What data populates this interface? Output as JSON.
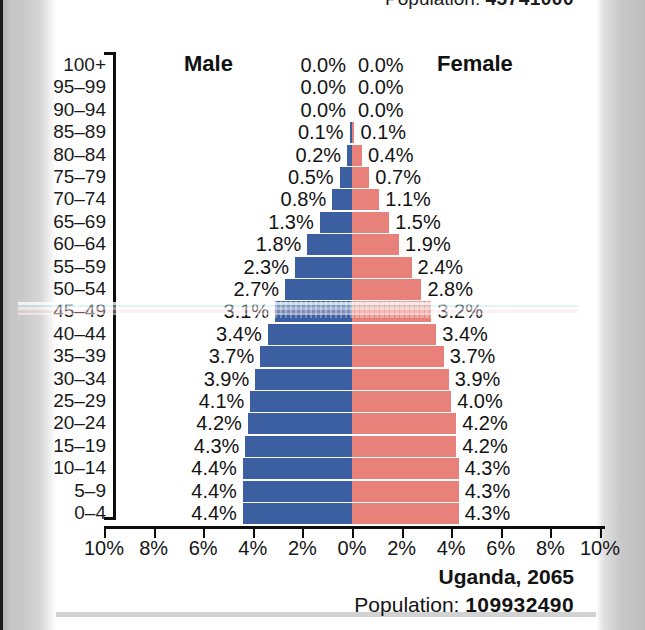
{
  "header": {
    "population_label": "Population:",
    "population_value": "45741000"
  },
  "footer": {
    "country_year": "Uganda, 2065",
    "population_label": "Population:",
    "population_value": "109932490"
  },
  "legend": {
    "male": "Male",
    "female": "Female"
  },
  "colors": {
    "male_bar": "#3b5fa0",
    "female_bar": "#e8817a",
    "axis": "#0d0d0d",
    "text": "#131313",
    "sheet": "#ffffff"
  },
  "chart_data": {
    "type": "bar",
    "subtype": "population-pyramid",
    "title": "Uganda, 2065",
    "xlabel": "",
    "ylabel": "",
    "xlim": [
      -10,
      10
    ],
    "grid": false,
    "legend_position": "top-inside",
    "x_tick_labels": [
      "10%",
      "8%",
      "6%",
      "4%",
      "2%",
      "0%",
      "2%",
      "4%",
      "6%",
      "8%",
      "10%"
    ],
    "x_tick_values": [
      -10,
      -8,
      -6,
      -4,
      -2,
      0,
      2,
      4,
      6,
      8,
      10
    ],
    "categories": [
      "100+",
      "95–99",
      "90–94",
      "85–89",
      "80–84",
      "75–79",
      "70–74",
      "65–69",
      "60–64",
      "55–59",
      "50–54",
      "45–49",
      "40–44",
      "35–39",
      "30–34",
      "25–29",
      "20–24",
      "15–19",
      "10–14",
      "5–9",
      "0–4"
    ],
    "series": [
      {
        "name": "Male",
        "color": "#3b5fa0",
        "values": [
          0.0,
          0.0,
          0.0,
          0.1,
          0.2,
          0.5,
          0.8,
          1.3,
          1.8,
          2.3,
          2.7,
          3.1,
          3.4,
          3.7,
          3.9,
          4.1,
          4.2,
          4.3,
          4.4,
          4.4,
          4.4
        ],
        "labels": [
          "0.0%",
          "0.0%",
          "0.0%",
          "0.1%",
          "0.2%",
          "0.5%",
          "0.8%",
          "1.3%",
          "1.8%",
          "2.3%",
          "2.7%",
          "3.1%",
          "3.4%",
          "3.7%",
          "3.9%",
          "4.1%",
          "4.2%",
          "4.3%",
          "4.4%",
          "4.4%",
          "4.4%"
        ]
      },
      {
        "name": "Female",
        "color": "#e8817a",
        "values": [
          0.0,
          0.0,
          0.0,
          0.1,
          0.4,
          0.7,
          1.1,
          1.5,
          1.9,
          2.4,
          2.8,
          3.2,
          3.4,
          3.7,
          3.9,
          4.0,
          4.2,
          4.2,
          4.3,
          4.3,
          4.3
        ],
        "labels": [
          "0.0%",
          "0.0%",
          "0.0%",
          "0.1%",
          "0.4%",
          "0.7%",
          "1.1%",
          "1.5%",
          "1.9%",
          "2.4%",
          "2.8%",
          "3.2%",
          "3.4%",
          "3.7%",
          "3.9%",
          "4.0%",
          "4.2%",
          "4.2%",
          "4.3%",
          "4.3%",
          "4.3%"
        ]
      }
    ]
  }
}
